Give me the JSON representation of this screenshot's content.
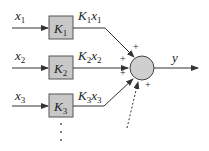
{
  "diagram": {
    "inputs": [
      {
        "name": "x",
        "sub": "1",
        "gain": "K",
        "gain_sub": "1",
        "product": "K",
        "product_sub1": "1",
        "product_var": "x",
        "product_sub2": "1"
      },
      {
        "name": "x",
        "sub": "2",
        "gain": "K",
        "gain_sub": "2",
        "product": "K",
        "product_sub1": "2",
        "product_var": "x",
        "product_sub2": "2"
      },
      {
        "name": "x",
        "sub": "3",
        "gain": "K",
        "gain_sub": "3",
        "product": "K",
        "product_sub1": "3",
        "product_var": "x",
        "product_sub2": "3"
      }
    ],
    "ellipsis": "⋮",
    "summing_junction": {
      "signs": [
        "+",
        "+",
        "+",
        "+"
      ]
    },
    "output": "y",
    "colors": {
      "block_fill": "#c8c8c8",
      "junction_fill": "#cfcfcf",
      "stroke": "#333333"
    }
  }
}
